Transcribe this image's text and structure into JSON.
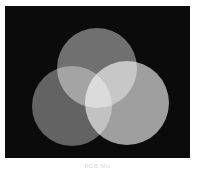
{
  "figure": {
    "caption": "RGB Mix",
    "background_color": "#ffffff",
    "panel_color": "#0b0b0b"
  },
  "chart_data": {
    "type": "scatter",
    "subtitle": "",
    "xlabel": "",
    "ylabel": "",
    "grid": false,
    "legend_position": "none",
    "xlim": [
      0,
      185
    ],
    "ylim": [
      0,
      152
    ],
    "blend_mode": "screen",
    "panel": {
      "x": 5,
      "y": 6,
      "width": 185,
      "height": 152,
      "background": "#0b0b0b"
    },
    "series": [
      {
        "name": "Top circle",
        "label": "top",
        "cx": 92,
        "cy": 62,
        "r": 40,
        "color": "#6a6a6a",
        "intensity": 0.42
      },
      {
        "name": "Lower-left circle",
        "label": "lower-left",
        "cx": 67,
        "cy": 100,
        "r": 40,
        "color": "#5c5c5c",
        "intensity": 0.36
      },
      {
        "name": "Lower-right circle",
        "label": "lower-right",
        "cx": 122,
        "cy": 97,
        "r": 42,
        "color": "#9b9b9b",
        "intensity": 0.61
      }
    ],
    "overlap_regions": [
      {
        "name": "top + lower-left",
        "color": "#6f6f6f"
      },
      {
        "name": "top + lower-right",
        "color": "#c8c8c8"
      },
      {
        "name": "lower-left + lower-right",
        "color": "#bdbdbd"
      },
      {
        "name": "all three (center)",
        "color": "#fdfdfd"
      }
    ]
  }
}
